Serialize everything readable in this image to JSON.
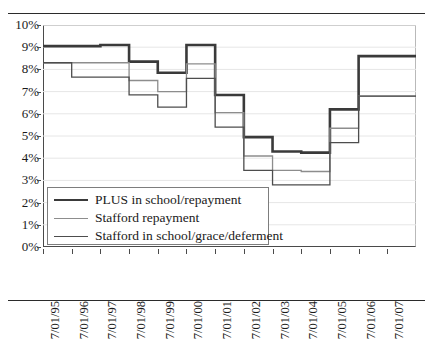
{
  "chart_data": {
    "type": "line",
    "step": true,
    "title": "",
    "xlabel": "",
    "ylabel": "",
    "ylim": [
      0,
      10
    ],
    "yticks": [
      0,
      1,
      2,
      3,
      4,
      5,
      6,
      7,
      8,
      9,
      10
    ],
    "ytick_labels": [
      "0%",
      "1%",
      "2%",
      "3%",
      "4%",
      "5%",
      "6%",
      "7%",
      "8%",
      "9%",
      "10%"
    ],
    "grid": true,
    "legend_position": "lower-left",
    "categories": [
      "7/01/95",
      "7/01/96",
      "7/01/97",
      "7/01/98",
      "7/01/99",
      "7/01/00",
      "7/01/01",
      "7/01/02",
      "7/01/03",
      "7/01/04",
      "7/01/05",
      "7/01/06",
      "7/01/07"
    ],
    "series": [
      {
        "name": "PLUS in school/repayment",
        "color": "#3a3a3a",
        "width": 2.6,
        "values": [
          9.05,
          9.05,
          9.1,
          8.35,
          7.85,
          9.1,
          6.85,
          4.95,
          4.3,
          4.25,
          6.2,
          8.6,
          8.6
        ]
      },
      {
        "name": "Stafford repayment",
        "color": "#8d8d8d",
        "width": 1.3,
        "values": [
          8.3,
          8.3,
          8.3,
          7.5,
          7.0,
          8.25,
          6.05,
          4.1,
          3.45,
          3.4,
          5.35,
          6.8,
          6.8
        ]
      },
      {
        "name": "Stafford in school/grace/deferment",
        "color": "#4d4d4d",
        "width": 1.3,
        "values": [
          8.3,
          7.65,
          7.65,
          6.85,
          6.3,
          7.6,
          5.4,
          3.45,
          2.8,
          2.8,
          4.7,
          6.8,
          6.8
        ]
      }
    ]
  },
  "legend": {
    "items": [
      {
        "label": "PLUS in school/repayment"
      },
      {
        "label": "Stafford repayment"
      },
      {
        "label": "Stafford in school/grace/deferment"
      }
    ]
  }
}
